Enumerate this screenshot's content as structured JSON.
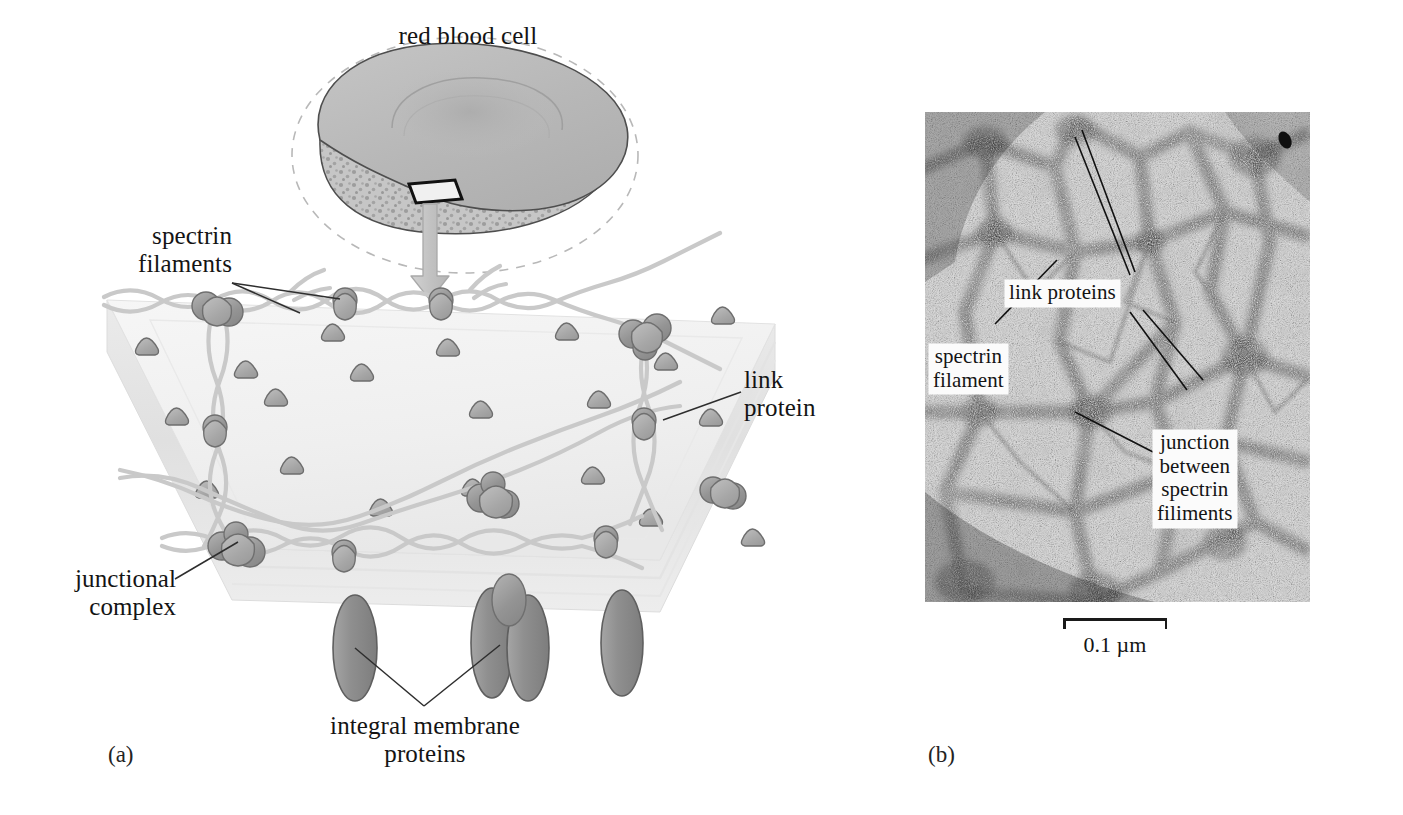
{
  "figure": {
    "panels": [
      {
        "letter": "(a)",
        "kind": "illustration"
      },
      {
        "letter": "(b)",
        "kind": "electron-micrograph"
      }
    ]
  },
  "panel_a": {
    "letter": "(a)",
    "cell_label": "red blood cell",
    "labels": {
      "spectrin_filaments": "spectrin\nfilaments",
      "link_protein": "link\nprotein",
      "junctional_complex": "junctional\ncomplex",
      "integral_membrane_proteins": "integral membrane\nproteins"
    },
    "colors": {
      "cell_fill": "#b9b9b9",
      "cell_cut_fill": "#c3c3c3",
      "cell_outline": "#4a4a4a",
      "membrane_top": "#f2f2f2",
      "membrane_side": "#e4e4e4",
      "filament": "#c8c8c8",
      "protein": "#9a9a9a",
      "protein_outline": "#6f6f6f",
      "arrow": "#c0c0c0",
      "leader_line": "#333333"
    }
  },
  "panel_b": {
    "letter": "(b)",
    "labels": {
      "link_proteins": "link proteins",
      "spectrin_filament": "spectrin\nfilament",
      "junction": "junction\nbetween\nspectrin\nfiliments"
    },
    "scale_bar": {
      "value": "0.1",
      "unit": "µm",
      "text": "0.1 µm"
    },
    "colors": {
      "grain_dark": "#1c1c1c",
      "grain_light": "#f2f2f2",
      "label_plate": "#fbfbfb"
    }
  }
}
